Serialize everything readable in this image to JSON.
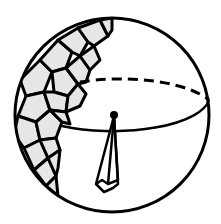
{
  "diagram": {
    "colors": {
      "stroke": "#000000",
      "cell_fill": "#e6e6e6",
      "background": "#ffffff"
    },
    "sphere": {
      "cx": 112,
      "cy": 115,
      "r": 97
    },
    "equator": {
      "cx": 112,
      "cy": 100,
      "rx": 97,
      "ry": 35
    },
    "center_point": {
      "x": 114,
      "y": 115
    }
  }
}
